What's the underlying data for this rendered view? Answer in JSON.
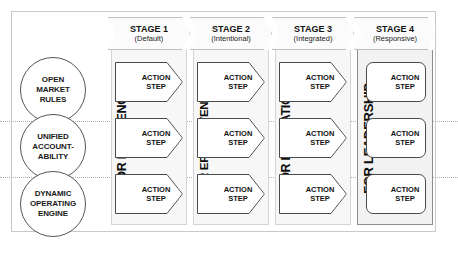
{
  "diagram": {
    "frame_color": "#c9c9c9"
  },
  "principles": [
    {
      "id": "open-market-rules",
      "lines": [
        "OPEN",
        "MARKET",
        "RULES"
      ]
    },
    {
      "id": "unified-accountability",
      "lines": [
        "UNIFIED",
        "ACCOUNT-",
        "ABILITY"
      ]
    },
    {
      "id": "dynamic-operating-engine",
      "lines": [
        "DYNAMIC",
        "OPERATING",
        "ENGINE"
      ]
    }
  ],
  "stages": [
    {
      "id": "stage-1",
      "title": "STAGE 1",
      "subtitle": "(Default)",
      "outcome": "FOR EFFICIENCY",
      "shape": "chevron",
      "highlight": false,
      "steps": [
        {
          "line1": "ACTION",
          "line2": "STEP"
        },
        {
          "line1": "ACTION",
          "line2": "STEP"
        },
        {
          "line1": "ACTION",
          "line2": "STEP"
        }
      ]
    },
    {
      "id": "stage-2",
      "title": "STAGE 2",
      "subtitle": "(Intentional)",
      "outcome": "FOR EFFECTIVENESS",
      "shape": "chevron",
      "highlight": false,
      "steps": [
        {
          "line1": "ACTION",
          "line2": "STEP"
        },
        {
          "line1": "ACTION",
          "line2": "STEP"
        },
        {
          "line1": "ACTION",
          "line2": "STEP"
        }
      ]
    },
    {
      "id": "stage-3",
      "title": "STAGE 3",
      "subtitle": "(Integrated)",
      "outcome": "FOR INNOVATION",
      "shape": "chevron",
      "highlight": false,
      "steps": [
        {
          "line1": "ACTION",
          "line2": "STEP"
        },
        {
          "line1": "ACTION",
          "line2": "STEP"
        },
        {
          "line1": "ACTION",
          "line2": "STEP"
        }
      ]
    },
    {
      "id": "stage-4",
      "title": "STAGE 4",
      "subtitle": "(Responsive)",
      "outcome": "FOR LEADERSHIP",
      "shape": "rounded",
      "highlight": true,
      "steps": [
        {
          "line1": "ACTION",
          "line2": "STEP"
        },
        {
          "line1": "ACTION",
          "line2": "STEP"
        },
        {
          "line1": "ACTION",
          "line2": "STEP"
        }
      ]
    }
  ]
}
